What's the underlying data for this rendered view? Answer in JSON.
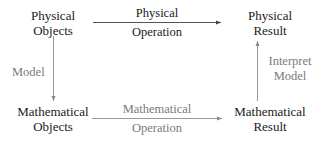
{
  "diagram": {
    "nodes": {
      "physical_objects": {
        "line1": "Physical",
        "line2": "Objects"
      },
      "physical_result": {
        "line1": "Physical",
        "line2": "Result"
      },
      "mathematical_objects": {
        "line1": "Mathematical",
        "line2": "Objects"
      },
      "mathematical_result": {
        "line1": "Mathematical",
        "line2": "Result"
      }
    },
    "edges": {
      "physical_operation": {
        "above": "Physical",
        "below": "Operation",
        "from": "Physical Objects",
        "to": "Physical Result",
        "color": "#1a1a1a"
      },
      "model": {
        "label": "Model",
        "from": "Physical Objects",
        "to": "Mathematical Objects",
        "color": "#7a7a7a"
      },
      "mathematical_operation": {
        "above": "Mathematical",
        "below": "Operation",
        "from": "Mathematical Objects",
        "to": "Mathematical Result",
        "color": "#7a7a7a"
      },
      "interpret_model": {
        "line1": "Interpret",
        "line2": "Model",
        "from": "Mathematical Result",
        "to": "Physical Result",
        "color": "#7a7a7a"
      }
    }
  }
}
